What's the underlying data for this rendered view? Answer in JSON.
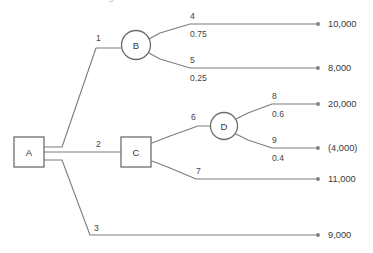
{
  "diagram": {
    "type": "decision-tree",
    "title_partial": "Decision tree diagram",
    "nodes": [
      {
        "id": "A",
        "label": "A",
        "shape": "square",
        "kind": "decision",
        "x": 29,
        "y": 152
      },
      {
        "id": "B",
        "label": "B",
        "shape": "circle",
        "kind": "chance",
        "x": 136,
        "y": 45
      },
      {
        "id": "C",
        "label": "C",
        "shape": "square",
        "kind": "decision",
        "x": 136,
        "y": 152
      },
      {
        "id": "D",
        "label": "D",
        "shape": "circle",
        "kind": "chance",
        "x": 224,
        "y": 126
      }
    ],
    "branches": [
      {
        "id": "1",
        "label": "1",
        "from": "A",
        "to": "B",
        "probability": "",
        "payoff": ""
      },
      {
        "id": "2",
        "label": "2",
        "from": "A",
        "to": "C",
        "probability": "",
        "payoff": ""
      },
      {
        "id": "3",
        "label": "3",
        "from": "A",
        "to": "terminal",
        "probability": "",
        "payoff": "9,000"
      },
      {
        "id": "4",
        "label": "4",
        "from": "B",
        "to": "terminal",
        "probability": "0.75",
        "payoff": "10,000"
      },
      {
        "id": "5",
        "label": "5",
        "from": "B",
        "to": "terminal",
        "probability": "0.25",
        "payoff": "8,000"
      },
      {
        "id": "6",
        "label": "6",
        "from": "C",
        "to": "D",
        "probability": "",
        "payoff": ""
      },
      {
        "id": "7",
        "label": "7",
        "from": "C",
        "to": "terminal",
        "probability": "",
        "payoff": "11,000"
      },
      {
        "id": "8",
        "label": "8",
        "from": "D",
        "to": "terminal",
        "probability": "0.6",
        "payoff": "20,000"
      },
      {
        "id": "9",
        "label": "9",
        "from": "D",
        "to": "terminal",
        "probability": "0.4",
        "payoff": "(4,000)"
      }
    ],
    "colors": {
      "line": "#7d7d7d",
      "node_stroke": "#6e6e6e",
      "text": "#3a3a3a",
      "background": "#ffffff"
    }
  }
}
